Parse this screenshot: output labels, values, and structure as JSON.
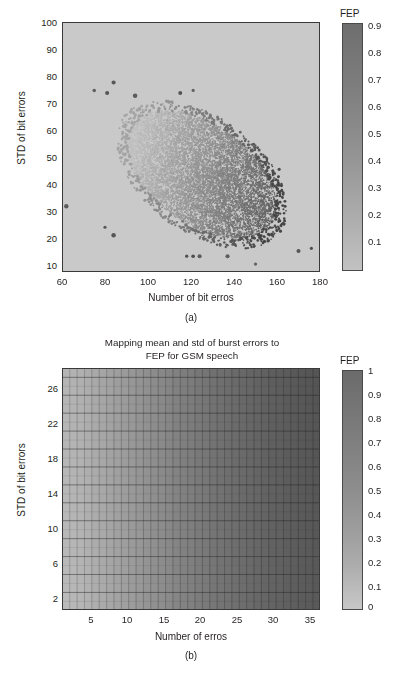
{
  "figure": {
    "background": "#ffffff",
    "plot_background": "#c9c9c9"
  },
  "panel_a": {
    "subfig_label": "(a)",
    "xlabel": "Number of bit erros",
    "ylabel": "STD of bit errors",
    "colorbar_title": "FEP",
    "xticks": [
      "60",
      "80",
      "100",
      "120",
      "140",
      "160",
      "180"
    ],
    "yticks": [
      "10",
      "20",
      "30",
      "40",
      "50",
      "60",
      "70",
      "80",
      "90",
      "100"
    ],
    "colorbar_ticks": [
      "0.9",
      "0.8",
      "0.7",
      "0.6",
      "0.5",
      "0.4",
      "0.3",
      "0.2",
      "0.1"
    ]
  },
  "panel_b": {
    "title": "Mapping mean and std of burst errors to\nFEP for GSM speech",
    "subfig_label": "(b)",
    "xlabel": "Number of erros",
    "ylabel": "STD of bit errors",
    "colorbar_title": "FEP",
    "xticks": [
      "5",
      "10",
      "15",
      "20",
      "25",
      "30",
      "35"
    ],
    "yticks": [
      "2",
      "6",
      "10",
      "14",
      "18",
      "22",
      "26"
    ],
    "colorbar_ticks": [
      "1",
      "0.9",
      "0.8",
      "0.7",
      "0.6",
      "0.5",
      "0.4",
      "0.3",
      "0.2",
      "0.1",
      "0"
    ]
  },
  "chart_data": [
    {
      "type": "scatter",
      "id": "panel-a",
      "title": "",
      "xlabel": "Number of bit erros",
      "ylabel": "STD of bit errors",
      "xlim": [
        60,
        180
      ],
      "ylim": [
        5,
        100
      ],
      "xticks": [
        60,
        80,
        100,
        120,
        140,
        160,
        180
      ],
      "yticks": [
        10,
        20,
        30,
        40,
        50,
        60,
        70,
        80,
        90,
        100
      ],
      "grid": false,
      "colormap": "grayscale",
      "colorbar": {
        "label": "FEP",
        "position": "right",
        "vmin": 0.04,
        "vmax": 0.94,
        "ticks": [
          0.1,
          0.2,
          0.3,
          0.4,
          0.5,
          0.6,
          0.7,
          0.8,
          0.9
        ]
      },
      "description": "Dense comet-shaped point cloud of (mean bit errors, std of bit errors) pairs colour coded by FEP; colour darkens toward the lower-right as FEP approaches 0.9.",
      "cloud": {
        "x_center": 125,
        "y_center": 42,
        "x_spread": 22,
        "y_spread": 13,
        "n_points": 9000,
        "boundary_points": 650
      },
      "outliers": [
        {
          "x": 75,
          "y": 74
        },
        {
          "x": 81,
          "y": 73
        },
        {
          "x": 84,
          "y": 77
        },
        {
          "x": 94,
          "y": 72
        },
        {
          "x": 115,
          "y": 73
        },
        {
          "x": 121,
          "y": 74
        },
        {
          "x": 62,
          "y": 30
        },
        {
          "x": 80,
          "y": 22
        },
        {
          "x": 84,
          "y": 19
        },
        {
          "x": 161,
          "y": 44
        },
        {
          "x": 170,
          "y": 13
        },
        {
          "x": 176,
          "y": 14
        },
        {
          "x": 118,
          "y": 11
        },
        {
          "x": 121,
          "y": 11
        },
        {
          "x": 124,
          "y": 11
        },
        {
          "x": 137,
          "y": 11
        },
        {
          "x": 150,
          "y": 8
        }
      ]
    },
    {
      "type": "heatmap",
      "id": "panel-b",
      "title": "Mapping mean and std of burst errors to FEP for GSM speech",
      "xlabel": "Number of erros",
      "ylabel": "STD of bit errors",
      "xlim": [
        1,
        35
      ],
      "ylim": [
        1,
        27
      ],
      "xticks": [
        5,
        10,
        15,
        20,
        25,
        30,
        35
      ],
      "yticks": [
        2,
        6,
        10,
        14,
        18,
        22,
        26
      ],
      "grid": true,
      "colormap": "grayscale",
      "colorbar": {
        "label": "FEP",
        "position": "right",
        "vmin": 0.0,
        "vmax": 1.0,
        "ticks": [
          0,
          0.1,
          0.2,
          0.3,
          0.4,
          0.5,
          0.6,
          0.7,
          0.8,
          0.9,
          1.0
        ]
      },
      "cells": {
        "cols": 35,
        "rows": 27
      },
      "description": "Mesh surface of FEP versus number of errors (x) and std of bit errors (y). FEP rises monotonically with number of errors from about 0.15 at x=1 to about 0.95 at x=35, with only a weak dependence on std of bit errors.",
      "value_at_x": [
        0.14,
        0.16,
        0.18,
        0.21,
        0.24,
        0.27,
        0.3,
        0.33,
        0.36,
        0.39,
        0.42,
        0.45,
        0.48,
        0.51,
        0.54,
        0.57,
        0.6,
        0.62,
        0.65,
        0.67,
        0.7,
        0.72,
        0.74,
        0.76,
        0.78,
        0.8,
        0.82,
        0.84,
        0.86,
        0.87,
        0.89,
        0.9,
        0.92,
        0.93,
        0.94
      ]
    }
  ]
}
